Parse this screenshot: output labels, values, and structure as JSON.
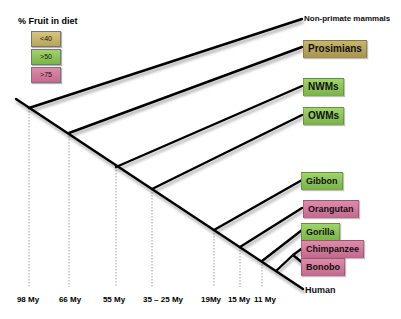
{
  "legend": {
    "title": "% Fruit in diet",
    "items": [
      {
        "label": "<40",
        "color": "#c8b56a"
      },
      {
        "label": ">50",
        "color": "#8fc55a"
      },
      {
        "label": ">75",
        "color": "#d57d9e"
      }
    ]
  },
  "taxa": [
    {
      "name": "Non-primate mammals",
      "category": "none"
    },
    {
      "name": "Prosimians",
      "category": "<40"
    },
    {
      "name": "NWMs",
      "category": ">50"
    },
    {
      "name": "OWMs",
      "category": ">50"
    },
    {
      "name": "Gibbon",
      "category": ">50"
    },
    {
      "name": "Orangutan",
      "category": ">75"
    },
    {
      "name": "Gorilla",
      "category": ">50"
    },
    {
      "name": "Chimpanzee",
      "category": ">75"
    },
    {
      "name": "Bonobo",
      "category": ">75"
    },
    {
      "name": "Human",
      "category": "none"
    }
  ],
  "time_axis": [
    {
      "label": "98 My"
    },
    {
      "label": "66 My"
    },
    {
      "label": "55 My"
    },
    {
      "label": "35 – 25 My"
    },
    {
      "label": "19My"
    },
    {
      "label": "15 My"
    },
    {
      "label": "11 My"
    }
  ]
}
